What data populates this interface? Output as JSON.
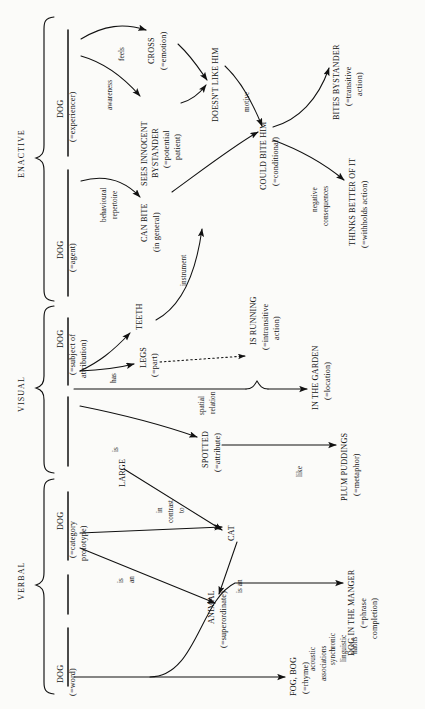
{
  "diagram": {
    "orientation": "rotated-90-ccw",
    "canvas": {
      "width": 425,
      "height": 709
    },
    "ink": "#111111"
  },
  "groups": [
    {
      "id": "enactive",
      "label": "ENACTIVE"
    },
    {
      "id": "visual",
      "label": "VISUAL"
    },
    {
      "id": "verbal",
      "label": "VERBAL"
    }
  ],
  "nodes": [
    {
      "id": "dog-experiencer",
      "line1": "DOG",
      "line2": "(=experiencer)"
    },
    {
      "id": "cross",
      "line1": "CROSS",
      "line2": "(=emotion)"
    },
    {
      "id": "sees-innocent-bystander",
      "line1": "SEES INNOCENT",
      "line1b": "BYSTANDER",
      "line2": "(=potential",
      "line2b": "patient)"
    },
    {
      "id": "doesnt-like-him",
      "line1": "DOESN'T LIKE HIM",
      "line2": ""
    },
    {
      "id": "dog-agent",
      "line1": "DOG",
      "line2": "(=agent)"
    },
    {
      "id": "can-bite",
      "line1": "CAN BITE",
      "line2": "(in general)"
    },
    {
      "id": "could-bite-him",
      "line1": "COULD BITE HIM",
      "line2": "(=conditional)"
    },
    {
      "id": "bites-bystander",
      "line1": "BITES BYSTANDER",
      "line2": "(=transitive",
      "line2b": "action)"
    },
    {
      "id": "thinks-better-of-it",
      "line1": "THINKS BETTER OF IT",
      "line2": "(=withholds action)"
    },
    {
      "id": "dog-subject-of-attribution",
      "line1": "DOG",
      "line2": "(=subject of",
      "line2b": "attribution)"
    },
    {
      "id": "teeth",
      "line1": "TEETH",
      "line2": ""
    },
    {
      "id": "legs",
      "line1": "LEGS",
      "line2": "(=part)"
    },
    {
      "id": "is-running",
      "line1": "IS RUNNING",
      "line2": "(=intransitive",
      "line2b": "action)"
    },
    {
      "id": "in-the-garden",
      "line1": "IN THE GARDEN",
      "line2": "(=location)"
    },
    {
      "id": "spotted",
      "line1": "SPOTTED",
      "line2": "(=attribute)"
    },
    {
      "id": "plum-puddings",
      "line1": "PLUM PUDDINGS",
      "line2": "(=metaphor)"
    },
    {
      "id": "large",
      "line1": "LARGE",
      "line2": ""
    },
    {
      "id": "dog-category-prototype",
      "line1": "DOG",
      "line2": "(=category",
      "line2b": "prototype)"
    },
    {
      "id": "cat",
      "line1": "CAT",
      "line2": ""
    },
    {
      "id": "animal",
      "line1": "ANIMAL",
      "line2": "(=superordinate)"
    },
    {
      "id": "dog-word",
      "line1": "DOG",
      "line2": "(=word)"
    },
    {
      "id": "dog-in-the-manger",
      "line1": "DOG IN THE MANGER",
      "line2": "(=phrase",
      "line2b": "completion)"
    },
    {
      "id": "fog-bog",
      "line1": "FOG, BOG",
      "line2": "(=rhyme)"
    }
  ],
  "edges": [
    {
      "id": "e-feels",
      "from": "dog-experiencer",
      "to": "cross",
      "label": "feels"
    },
    {
      "id": "e-awareness",
      "from": "dog-experiencer",
      "to": "sees-innocent-bystander",
      "label": "awareness"
    },
    {
      "id": "e-cross-dislike",
      "from": "cross",
      "to": "doesnt-like-him",
      "label": ""
    },
    {
      "id": "e-bystander-dislike",
      "from": "sees-innocent-bystander",
      "to": "doesnt-like-him",
      "label": ""
    },
    {
      "id": "e-motive",
      "from": "doesnt-like-him",
      "to": "could-bite-him",
      "label": "motive"
    },
    {
      "id": "e-behavioural-repertoire",
      "from": "dog-agent",
      "to": "can-bite",
      "label1": "behavioural",
      "label2": "repertoire"
    },
    {
      "id": "e-canbite-couldbite",
      "from": "can-bite",
      "to": "could-bite-him",
      "label": ""
    },
    {
      "id": "e-bites",
      "from": "could-bite-him",
      "to": "bites-bystander",
      "label": ""
    },
    {
      "id": "e-negative-consequences",
      "from": "could-bite-him",
      "to": "thinks-better-of-it",
      "label1": "negative",
      "label2": "consequences"
    },
    {
      "id": "e-instrument",
      "from": "teeth",
      "to": "can-bite",
      "label": "instrument"
    },
    {
      "id": "e-has",
      "from": "dog-subject-of-attribution",
      "to": "teeth-and-legs",
      "label": "has"
    },
    {
      "id": "e-legs-running",
      "from": "legs",
      "to": "is-running",
      "label": "",
      "style": "dotted"
    },
    {
      "id": "e-spatial-relation",
      "from": "dog-subject-of-attribution",
      "to": "in-the-garden",
      "label1": "spatial",
      "label2": "relation"
    },
    {
      "id": "e-is",
      "from": "dog-subject-of-attribution",
      "to": "spotted",
      "label": "is"
    },
    {
      "id": "e-like",
      "from": "spotted",
      "to": "plum-puddings",
      "label": "like"
    },
    {
      "id": "e-in-contrast-to",
      "from": "large",
      "to": "cat",
      "label1": "in",
      "label2": "contrast",
      "label3": "to"
    },
    {
      "id": "e-proto-cat",
      "from": "dog-category-prototype",
      "to": "cat",
      "label": ""
    },
    {
      "id": "e-is-an-animal",
      "from": "dog-category-prototype",
      "to": "animal",
      "label1": "is",
      "label2": "an"
    },
    {
      "id": "e-cat-is-an-animal",
      "from": "cat",
      "to": "animal",
      "label": "is an"
    },
    {
      "id": "e-synchronic",
      "from": "dog-word",
      "to": "dog-in-the-manger",
      "label1": "synchronic",
      "label2": "linguistic",
      "label3": "habits"
    },
    {
      "id": "e-acoustic",
      "from": "dog-word",
      "to": "fog-bog",
      "label1": "acoustic",
      "label2": "associations"
    }
  ]
}
